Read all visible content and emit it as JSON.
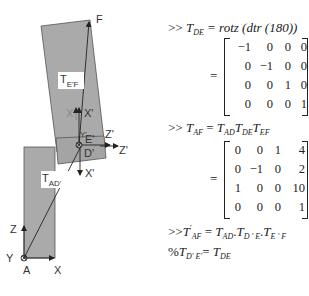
{
  "diagram": {
    "labels": {
      "F": "F",
      "TEF_main": "T",
      "TEF_sub": "E'F",
      "X_upper": "X",
      "X_prime_upper": "X'",
      "Y_prime": "Y'",
      "E_prime": "E'",
      "Z_prime_1": "Z'",
      "Z_prime_2": "Z'",
      "D_prime": "D'",
      "X_prime_lower": "X'",
      "TAD_main": "T",
      "TAD_sub": "AD'",
      "Z": "Z",
      "Y": "Y",
      "A": "A",
      "X": "X"
    },
    "colors": {
      "link_fill": "#aaaaaa",
      "link_stroke": "#555555",
      "arrow": "#222222",
      "label_box": "#ffffff"
    }
  },
  "equations": {
    "line1": {
      "prompt": ">>",
      "lhs": "T",
      "lhs_sub": "DE",
      "rhs": "= rotz (dtr (180))"
    },
    "matrix1": {
      "rows": [
        [
          "−1",
          "0",
          "0",
          "0"
        ],
        [
          "0",
          "−1",
          "0",
          "0"
        ],
        [
          "0",
          "0",
          "1",
          "0"
        ],
        [
          "0",
          "0",
          "0",
          "1"
        ]
      ]
    },
    "line2": {
      "prompt": ">>",
      "lhs": "T",
      "lhs_sub": "AF",
      "eq": "=",
      "t1": "T",
      "t1_sub": "AD",
      "t2": "T",
      "t2_sub": "DE",
      "t3": "T",
      "t3_sub": "EF"
    },
    "matrix2": {
      "rows": [
        [
          "0",
          "0",
          "1",
          "4"
        ],
        [
          "0",
          "−1",
          "0",
          "2"
        ],
        [
          "1",
          "0",
          "0",
          "10"
        ],
        [
          "0",
          "0",
          "0",
          "1"
        ]
      ]
    },
    "line3": {
      "prompt": ">>",
      "lhs": "T",
      "lhs_sup": "′",
      "lhs_sub": "AF",
      "eq": "=",
      "t1": "T",
      "t1_sub": "AD",
      "dot1": ".",
      "t2": "T",
      "t2_sub": "D ' E",
      "dot2": ".",
      "t3": "T",
      "t3_sub": "E ' F"
    },
    "line4": {
      "prefix": "%",
      "lhs": "T",
      "lhs_sub": "D' E'",
      "eq": "=",
      "rhs": "T",
      "rhs_sub": "DE"
    },
    "equals_sign": "="
  }
}
